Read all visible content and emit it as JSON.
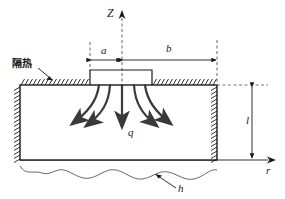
{
  "figure": {
    "name": "heat-conduction-schematic",
    "colors": {
      "line": "#1a1a1a",
      "flux_arrow": "#3a3a3a",
      "dashed": "#555555",
      "background": "#ffffff"
    }
  },
  "labels": {
    "axis_z": "Z",
    "axis_r": "r",
    "dim_a": "a",
    "dim_b": "b",
    "dim_l": "l",
    "heat_flux": "q",
    "convection_coeff": "h",
    "insulation": "隔热"
  },
  "geometry": {
    "slab_left_x": 20,
    "slab_right_x": 217,
    "slab_top_y": 85,
    "slab_bottom_y": 160,
    "axis_center_x": 122,
    "source_left_x": 90,
    "source_right_x": 152,
    "source_top_y": 70,
    "dim_a_from_x": 90,
    "dim_a_to_x": 122,
    "dim_b_from_x": 122,
    "dim_b_to_x": 217,
    "dim_line_y": 60,
    "dim_l_x": 252,
    "dim_l_top_y": 85,
    "dim_l_bottom_y": 160
  },
  "flux_arrows": {
    "count": 5,
    "directions": [
      "down-left-far",
      "down-left-near",
      "down-center",
      "down-right-near",
      "down-right-far"
    ]
  }
}
